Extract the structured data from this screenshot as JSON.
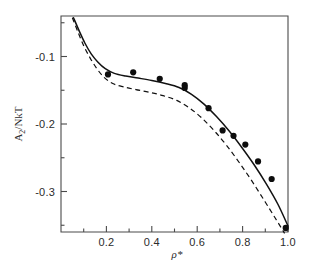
{
  "chart_data": {
    "type": "scatter",
    "title": "",
    "subtitle": "",
    "xlabel": "ρ*",
    "ylabel": "A₂/NkT",
    "xlim": [
      0.0,
      1.0
    ],
    "ylim": [
      -0.36,
      -0.04
    ],
    "grid": false,
    "legend_position": "none",
    "x_ticks_major": [
      "0.2",
      "0.4",
      "0.6",
      "0.8",
      "1.0"
    ],
    "x_tick_major_values": [
      0.2,
      0.4,
      0.6,
      0.8,
      1.0
    ],
    "x_tick_minor_values": [
      0.1,
      0.3,
      0.5,
      0.7,
      0.9
    ],
    "y_ticks_major": [
      "-0.1",
      "-0.2",
      "-0.3"
    ],
    "y_tick_major_values": [
      -0.1,
      -0.2,
      -0.3
    ],
    "y_tick_minor_values": [
      -0.05,
      -0.15,
      -0.25,
      -0.35
    ],
    "series": [
      {
        "name": "simulation-points",
        "style": "filled-circle-markers",
        "marker": "circle",
        "color": "#0d0d0d",
        "points": [
          {
            "x": 0.207,
            "y": -0.1265
          },
          {
            "x": 0.318,
            "y": -0.1235
          },
          {
            "x": 0.435,
            "y": -0.133
          },
          {
            "x": 0.545,
            "y": -0.1425
          },
          {
            "x": 0.545,
            "y": -0.1465
          },
          {
            "x": 0.65,
            "y": -0.1765
          },
          {
            "x": 0.712,
            "y": -0.2095
          },
          {
            "x": 0.76,
            "y": -0.2175
          },
          {
            "x": 0.812,
            "y": -0.2305
          },
          {
            "x": 0.868,
            "y": -0.2555
          },
          {
            "x": 0.928,
            "y": -0.2815
          },
          {
            "x": 0.99,
            "y": -0.354
          }
        ]
      },
      {
        "name": "theory-solid-curve",
        "style": "solid-line",
        "color": "#111111",
        "points": [
          {
            "x": 0.055,
            "y": -0.0425
          },
          {
            "x": 0.08,
            "y": -0.062
          },
          {
            "x": 0.105,
            "y": -0.08
          },
          {
            "x": 0.133,
            "y": -0.096
          },
          {
            "x": 0.162,
            "y": -0.108
          },
          {
            "x": 0.195,
            "y": -0.118
          },
          {
            "x": 0.235,
            "y": -0.125
          },
          {
            "x": 0.285,
            "y": -0.129
          },
          {
            "x": 0.34,
            "y": -0.132
          },
          {
            "x": 0.4,
            "y": -0.1355
          },
          {
            "x": 0.46,
            "y": -0.14
          },
          {
            "x": 0.52,
            "y": -0.146
          },
          {
            "x": 0.575,
            "y": -0.156
          },
          {
            "x": 0.63,
            "y": -0.1705
          },
          {
            "x": 0.685,
            "y": -0.189
          },
          {
            "x": 0.74,
            "y": -0.21
          },
          {
            "x": 0.795,
            "y": -0.234
          },
          {
            "x": 0.85,
            "y": -0.26
          },
          {
            "x": 0.905,
            "y": -0.289
          },
          {
            "x": 0.955,
            "y": -0.3185
          },
          {
            "x": 1.0,
            "y": -0.351
          }
        ]
      },
      {
        "name": "theory-dashed-curve",
        "style": "dashed-line",
        "color": "#111111",
        "points": [
          {
            "x": 0.05,
            "y": -0.0425
          },
          {
            "x": 0.075,
            "y": -0.064
          },
          {
            "x": 0.1,
            "y": -0.084
          },
          {
            "x": 0.128,
            "y": -0.102
          },
          {
            "x": 0.158,
            "y": -0.118
          },
          {
            "x": 0.19,
            "y": -0.131
          },
          {
            "x": 0.228,
            "y": -0.14
          },
          {
            "x": 0.275,
            "y": -0.145
          },
          {
            "x": 0.33,
            "y": -0.149
          },
          {
            "x": 0.39,
            "y": -0.153
          },
          {
            "x": 0.45,
            "y": -0.158
          },
          {
            "x": 0.51,
            "y": -0.165
          },
          {
            "x": 0.565,
            "y": -0.176
          },
          {
            "x": 0.62,
            "y": -0.191
          },
          {
            "x": 0.675,
            "y": -0.21
          },
          {
            "x": 0.73,
            "y": -0.232
          },
          {
            "x": 0.785,
            "y": -0.257
          },
          {
            "x": 0.84,
            "y": -0.284
          },
          {
            "x": 0.895,
            "y": -0.313
          },
          {
            "x": 0.945,
            "y": -0.34
          },
          {
            "x": 0.985,
            "y": -0.362
          }
        ]
      }
    ]
  },
  "axes": {
    "x_title_base": "ρ",
    "x_title_star": "*",
    "y_title_main": "A",
    "y_title_sub": "2",
    "y_title_rest": "/NkT"
  }
}
